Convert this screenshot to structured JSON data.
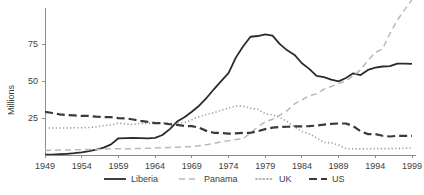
{
  "chart_data": {
    "type": "line",
    "title": "",
    "xlabel": "",
    "ylabel": "Millions",
    "x": [
      1949,
      1950,
      1951,
      1952,
      1953,
      1954,
      1955,
      1956,
      1957,
      1958,
      1959,
      1960,
      1961,
      1962,
      1963,
      1964,
      1965,
      1966,
      1967,
      1968,
      1969,
      1970,
      1971,
      1972,
      1973,
      1974,
      1975,
      1976,
      1977,
      1978,
      1979,
      1980,
      1981,
      1982,
      1983,
      1984,
      1985,
      1986,
      1987,
      1988,
      1989,
      1990,
      1991,
      1992,
      1993,
      1994,
      1995,
      1996,
      1997,
      1998,
      1999
    ],
    "xlim": [
      1949,
      1999
    ],
    "ylim": [
      0,
      100
    ],
    "xticks": [
      1949,
      1954,
      1959,
      1964,
      1969,
      1974,
      1979,
      1984,
      1989,
      1994,
      1999
    ],
    "xtick_labels": [
      "1949",
      "1954",
      "1959",
      "1964",
      "1969",
      "1974",
      "1979",
      "1984",
      "1989",
      "1994",
      "1999"
    ],
    "yticks": [
      25,
      50,
      75
    ],
    "ytick_labels": [
      "25",
      "50",
      "75"
    ],
    "grid": false,
    "legend_position": "bottom",
    "series": [
      {
        "name": "Liberia",
        "style": "solid",
        "color": "#2b2b2b",
        "width": 1.8,
        "values": [
          0.2,
          0.3,
          0.5,
          0.8,
          1.2,
          1.8,
          2.6,
          3.6,
          5.0,
          7.2,
          11.3,
          11.4,
          11.5,
          11.4,
          11.3,
          11.6,
          13.5,
          17.5,
          22.6,
          25.5,
          29.2,
          33.3,
          38.5,
          44.4,
          49.9,
          55.3,
          65.8,
          73.5,
          79.9,
          80.4,
          81.5,
          80.6,
          74.9,
          70.7,
          67.6,
          62.0,
          58.2,
          53.5,
          52.6,
          51.0,
          49.7,
          52.0,
          55.2,
          54.0,
          57.5,
          59.0,
          59.8,
          60.1,
          61.7,
          61.7,
          61.6
        ]
      },
      {
        "name": "Panama",
        "style": "dashed-light",
        "color": "#b9b9b9",
        "width": 1.5,
        "values": [
          3.0,
          3.2,
          3.3,
          3.4,
          3.5,
          3.6,
          3.7,
          3.8,
          4.0,
          4.2,
          4.3,
          4.3,
          4.3,
          4.4,
          4.5,
          4.7,
          4.9,
          5.1,
          5.3,
          5.5,
          5.6,
          6.3,
          7.0,
          7.8,
          8.9,
          9.6,
          10.5,
          11.0,
          15.0,
          19.0,
          22.4,
          24.2,
          27.0,
          30.0,
          34.6,
          37.3,
          40.0,
          41.3,
          44.5,
          46.3,
          48.2,
          50.0,
          53.6,
          57.6,
          64.0,
          69.1,
          71.9,
          82.1,
          91.1,
          98.2,
          105.0
        ]
      },
      {
        "name": "UK",
        "style": "dotted",
        "color": "#9a9a9a",
        "width": 1.6,
        "values": [
          18.2,
          18.2,
          18.2,
          18.3,
          18.4,
          18.4,
          18.6,
          19.0,
          19.9,
          20.3,
          21.5,
          21.1,
          20.6,
          21.4,
          21.4,
          21.2,
          21.6,
          21.4,
          21.7,
          21.9,
          23.8,
          25.8,
          27.3,
          28.6,
          30.2,
          31.5,
          33.2,
          32.9,
          31.6,
          30.9,
          27.9,
          27.1,
          25.4,
          22.5,
          19.1,
          15.9,
          14.3,
          11.6,
          8.5,
          8.3,
          6.7,
          4.3,
          4.2,
          4.1,
          4.2,
          4.3,
          4.3,
          4.3,
          4.4,
          4.6,
          4.8
        ]
      },
      {
        "name": "US",
        "style": "dashed-dark",
        "color": "#3a3a3a",
        "width": 2.2,
        "values": [
          29.2,
          28.4,
          27.5,
          27.0,
          26.8,
          26.4,
          26.4,
          25.9,
          25.6,
          25.6,
          24.9,
          24.8,
          24.0,
          23.1,
          22.4,
          21.5,
          21.5,
          20.8,
          20.3,
          19.6,
          19.5,
          18.5,
          16.3,
          15.0,
          14.9,
          14.4,
          14.6,
          14.9,
          15.0,
          16.1,
          17.5,
          18.5,
          18.9,
          19.1,
          19.4,
          19.3,
          19.5,
          19.9,
          20.5,
          21.0,
          21.3,
          21.3,
          19.5,
          16.0,
          14.1,
          14.1,
          13.0,
          12.5,
          13.0,
          12.9,
          12.9
        ]
      }
    ]
  },
  "legend": {
    "items": [
      {
        "label": "Liberia"
      },
      {
        "label": "Panama"
      },
      {
        "label": "UK"
      },
      {
        "label": "US"
      }
    ]
  },
  "axes": {
    "y_axis_title": "Millions"
  }
}
